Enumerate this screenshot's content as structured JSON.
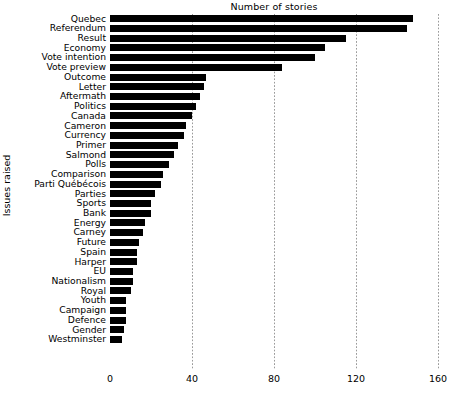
{
  "chart_data": {
    "type": "bar",
    "orientation": "horizontal",
    "title": "Number of stories",
    "xlabel": "Number of stories",
    "ylabel": "Issues raised",
    "xlim": [
      0,
      160
    ],
    "xticks": [
      0,
      40,
      80,
      120,
      160
    ],
    "grid": "vertical-dotted",
    "legend": "none",
    "bar_color": "#000000",
    "categories": [
      "Quebec",
      "Referendum",
      "Result",
      "Economy",
      "Vote intention",
      "Vote preview",
      "Outcome",
      "Letter",
      "Aftermath",
      "Politics",
      "Canada",
      "Cameron",
      "Currency",
      "Primer",
      "Salmond",
      "Polls",
      "Comparison",
      "Parti Québécois",
      "Parties",
      "Sports",
      "Bank",
      "Energy",
      "Carney",
      "Future",
      "Spain",
      "Harper",
      "EU",
      "Nationalism",
      "Royal",
      "Youth",
      "Campaign",
      "Defence",
      "Gender",
      "Westminster"
    ],
    "values": [
      148,
      145,
      115,
      105,
      100,
      84,
      47,
      46,
      44,
      42,
      40,
      37,
      36,
      33,
      31,
      29,
      26,
      25,
      22,
      20,
      20,
      17,
      16,
      14,
      13,
      13,
      11,
      11,
      10,
      8,
      8,
      8,
      7,
      6
    ]
  }
}
